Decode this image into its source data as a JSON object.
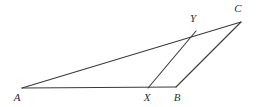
{
  "figure": {
    "type": "geometry-diagram",
    "canvas": {
      "width": 268,
      "height": 107
    },
    "background_color": "#ffffff",
    "line_color": "#3a3a3a",
    "label_color": "#2f2f2f",
    "points": [
      {
        "id": "A",
        "label": "A",
        "x": 22,
        "y": 88,
        "label_x": 17,
        "label_y": 97
      },
      {
        "id": "X",
        "label": "X",
        "x": 148,
        "y": 88,
        "label_x": 147,
        "label_y": 97
      },
      {
        "id": "B",
        "label": "B",
        "x": 176,
        "y": 87,
        "label_x": 177,
        "label_y": 97
      },
      {
        "id": "Y",
        "label": "Y",
        "x": 196,
        "y": 31,
        "label_x": 193,
        "label_y": 18
      },
      {
        "id": "C",
        "label": "C",
        "x": 241,
        "y": 22,
        "label_x": 238,
        "label_y": 8
      }
    ],
    "segments": [
      {
        "id": "AC",
        "from": "A",
        "to": "C",
        "path": "M 22 88 L 241 22"
      },
      {
        "id": "AB",
        "from": "A",
        "to": "B",
        "path": "M 22 88 L 176 87"
      },
      {
        "id": "XY",
        "from": "X",
        "to": "Y",
        "path": "M 148 88 L 196 31"
      },
      {
        "id": "BC",
        "from": "B",
        "to": "C",
        "path": "M 176 87 L 241 22"
      }
    ]
  }
}
